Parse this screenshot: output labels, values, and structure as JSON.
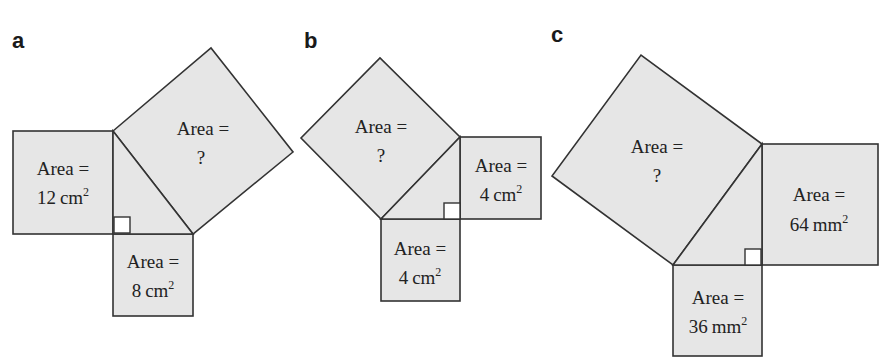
{
  "figure": {
    "panels": [
      {
        "id": "a",
        "label": "a",
        "legs": [
          {
            "position": "left",
            "line1": "Area =",
            "line2_value": "12",
            "line2_unit": "cm",
            "exponent": "2"
          },
          {
            "position": "bottom",
            "line1": "Area =",
            "line2_value": "8",
            "line2_unit": "cm",
            "exponent": "2"
          }
        ],
        "hypotenuse": {
          "line1": "Area =",
          "line2": "?"
        }
      },
      {
        "id": "b",
        "label": "b",
        "legs": [
          {
            "position": "right",
            "line1": "Area =",
            "line2_value": "4",
            "line2_unit": "cm",
            "exponent": "2"
          },
          {
            "position": "bottom",
            "line1": "Area =",
            "line2_value": "4",
            "line2_unit": "cm",
            "exponent": "2"
          }
        ],
        "hypotenuse": {
          "line1": "Area =",
          "line2": "?"
        }
      },
      {
        "id": "c",
        "label": "c",
        "legs": [
          {
            "position": "right",
            "line1": "Area =",
            "line2_value": "64",
            "line2_unit": "mm",
            "exponent": "2"
          },
          {
            "position": "bottom",
            "line1": "Area =",
            "line2_value": "36",
            "line2_unit": "mm",
            "exponent": "2"
          }
        ],
        "hypotenuse": {
          "line1": "Area =",
          "line2": "?"
        }
      }
    ],
    "colors": {
      "fill": "#e6e6e6",
      "stroke": "#333333",
      "right_angle_fill": "#ffffff"
    }
  }
}
